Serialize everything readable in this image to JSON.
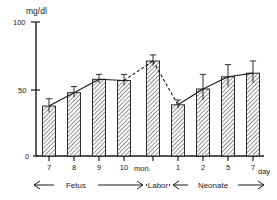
{
  "chart_data": {
    "type": "bar",
    "title": "",
    "ylabel": "mg/dl",
    "xlabel": "",
    "ylim": [
      0,
      110
    ],
    "yticks": [
      0,
      50,
      100
    ],
    "ytick_labels": [
      "0",
      "50",
      "100"
    ],
    "grid": false,
    "legend": null,
    "categories": [
      "7",
      "8",
      "9",
      "10",
      "",
      "1",
      "2",
      "5",
      "7"
    ],
    "x_unit_labels": [
      {
        "text": "mon.",
        "after_category_index": 3
      },
      {
        "text": "day",
        "after_category_index": 8
      }
    ],
    "values": [
      41,
      52,
      63,
      62,
      78,
      42,
      55,
      65,
      68
    ],
    "errors_upper": [
      6,
      5,
      4,
      5,
      5,
      4,
      12,
      10,
      10
    ],
    "errors_lower": [
      5,
      4,
      3,
      4,
      4,
      3,
      9,
      8,
      8
    ],
    "series": [
      {
        "name": "mean",
        "values": [
          41,
          52,
          63,
          62,
          78,
          42,
          55,
          65,
          68
        ]
      }
    ],
    "connector_style": [
      "solid",
      "solid",
      "solid",
      "dashed",
      "dashed",
      "solid",
      "solid",
      "solid"
    ],
    "group_brackets": [
      {
        "label": "Fetus",
        "from_category_index": 0,
        "to_category_index": 3,
        "arrows": "both"
      },
      {
        "label": "Labor",
        "from_category_index": 4,
        "to_category_index": 4,
        "arrows": "both"
      },
      {
        "label": "Neonate",
        "from_category_index": 5,
        "to_category_index": 8,
        "arrows": "both"
      }
    ],
    "bar_fill": "hatch",
    "bar_color": "#8c8c8c",
    "axis_color": "#1a1a1a"
  },
  "axes": {
    "y_axis_title": "mg/dl",
    "y_tick_100": "100",
    "y_tick_50": "50",
    "y_tick_0": "0"
  },
  "x_labels": {
    "c0": "7",
    "c1": "8",
    "c2": "9",
    "c3": "10",
    "unit_mon": "mon.",
    "c5": "1",
    "c6": "2",
    "c7": "5",
    "c8": "7",
    "unit_day": "day"
  },
  "brackets": {
    "fetus": "Fetus",
    "labor": "Labor",
    "neonate": "Neonate"
  }
}
